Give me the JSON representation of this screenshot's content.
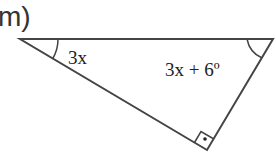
{
  "part_label": "m)",
  "figure": {
    "type": "right-triangle",
    "vertices": {
      "top_left": [
        20,
        39
      ],
      "top_right": [
        273,
        39
      ],
      "bottom": [
        207,
        150
      ]
    },
    "angles": [
      {
        "vertex": "top_left",
        "label": "3x"
      },
      {
        "vertex": "top_right",
        "label": "3x + 6º"
      },
      {
        "vertex": "bottom",
        "label": "",
        "right_angle": true
      }
    ],
    "stroke_color": "#444444"
  }
}
